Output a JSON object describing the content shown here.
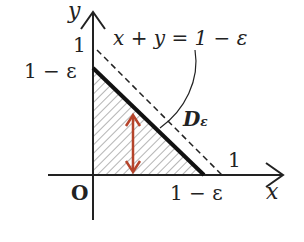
{
  "diagram": {
    "axis_x_label": "x",
    "axis_y_label": "y",
    "origin_label": "O",
    "y_tick_one": "1",
    "y_tick_one_minus_eps": "1 − ε",
    "x_tick_one": "1",
    "x_tick_one_minus_eps": "1 − ε",
    "line_label": "x + y = 1 − ε",
    "region_label_main": "D",
    "region_label_sub": "ε",
    "colors": {
      "ink": "#222222",
      "arrow": "#b5442b"
    }
  }
}
